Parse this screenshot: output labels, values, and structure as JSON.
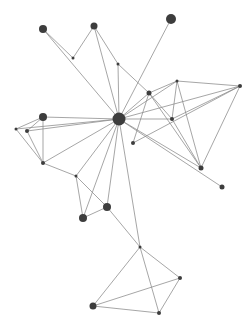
{
  "graph": {
    "type": "network",
    "width": 251,
    "height": 325,
    "colors": {
      "background": "#ffffff",
      "edge": "#8a8a8a",
      "node": "#3d3d3d",
      "hub": "#111111"
    },
    "nodes": [
      {
        "id": "hub",
        "x": 119,
        "y": 119,
        "r": 6.5,
        "color": "#111111"
      },
      {
        "id": "n1",
        "x": 43,
        "y": 29,
        "r": 4
      },
      {
        "id": "n2",
        "x": 94,
        "y": 26,
        "r": 3.5
      },
      {
        "id": "n3",
        "x": 171,
        "y": 19,
        "r": 5
      },
      {
        "id": "n4",
        "x": 73,
        "y": 58,
        "r": 1.5
      },
      {
        "id": "n5",
        "x": 118,
        "y": 64,
        "r": 1.5
      },
      {
        "id": "n6",
        "x": 149,
        "y": 93,
        "r": 2.5
      },
      {
        "id": "n7",
        "x": 177,
        "y": 81,
        "r": 1.5
      },
      {
        "id": "n8",
        "x": 240,
        "y": 86,
        "r": 2
      },
      {
        "id": "n9",
        "x": 172,
        "y": 119,
        "r": 2
      },
      {
        "id": "n10",
        "x": 133,
        "y": 143,
        "r": 2
      },
      {
        "id": "n11",
        "x": 201,
        "y": 168,
        "r": 2.5
      },
      {
        "id": "n12",
        "x": 222,
        "y": 187,
        "r": 2.5
      },
      {
        "id": "n13",
        "x": 43,
        "y": 117,
        "r": 4
      },
      {
        "id": "n14",
        "x": 16,
        "y": 129,
        "r": 1.5
      },
      {
        "id": "n15",
        "x": 27,
        "y": 131,
        "r": 2
      },
      {
        "id": "n16",
        "x": 43,
        "y": 163,
        "r": 2
      },
      {
        "id": "n17",
        "x": 76,
        "y": 176,
        "r": 1.5
      },
      {
        "id": "n18",
        "x": 107,
        "y": 207,
        "r": 4
      },
      {
        "id": "n19",
        "x": 83,
        "y": 218,
        "r": 4
      },
      {
        "id": "n20",
        "x": 140,
        "y": 247,
        "r": 1.5
      },
      {
        "id": "n21",
        "x": 180,
        "y": 278,
        "r": 2
      },
      {
        "id": "n22",
        "x": 159,
        "y": 313,
        "r": 2
      },
      {
        "id": "n23",
        "x": 93,
        "y": 306,
        "r": 3.5
      }
    ],
    "edges": [
      [
        "n1",
        "n4"
      ],
      [
        "n1",
        "hub"
      ],
      [
        "n1",
        "hub2"
      ],
      [
        "n2",
        "n4"
      ],
      [
        "n2",
        "n5"
      ],
      [
        "n2",
        "hub"
      ],
      [
        "n5",
        "n6"
      ],
      [
        "n5",
        "hub"
      ],
      [
        "n3",
        "hub"
      ],
      [
        "hub",
        "n6"
      ],
      [
        "hub",
        "n7"
      ],
      [
        "hub",
        "n8"
      ],
      [
        "hub",
        "n9"
      ],
      [
        "hub",
        "n11"
      ],
      [
        "hub",
        "n12"
      ],
      [
        "n6",
        "n7"
      ],
      [
        "n6",
        "n10"
      ],
      [
        "n6",
        "n9"
      ],
      [
        "n6",
        "n11"
      ],
      [
        "n7",
        "n8"
      ],
      [
        "n7",
        "n9"
      ],
      [
        "n7",
        "n11"
      ],
      [
        "n8",
        "n10"
      ],
      [
        "n8",
        "n11"
      ],
      [
        "n8",
        "n9"
      ],
      [
        "n9",
        "n11"
      ],
      [
        "hub",
        "n13"
      ],
      [
        "hub",
        "n14"
      ],
      [
        "hub",
        "n15"
      ],
      [
        "hub",
        "n16"
      ],
      [
        "n13",
        "n14"
      ],
      [
        "n13",
        "n15"
      ],
      [
        "n13",
        "n16"
      ],
      [
        "n14",
        "n16"
      ],
      [
        "n15",
        "n16"
      ],
      [
        "n16",
        "n17"
      ],
      [
        "hub",
        "n17"
      ],
      [
        "hub",
        "n19"
      ],
      [
        "hub",
        "n18"
      ],
      [
        "hub",
        "n20"
      ],
      [
        "n17",
        "n18"
      ],
      [
        "n17",
        "n19"
      ],
      [
        "n18",
        "n19"
      ],
      [
        "n18",
        "n20"
      ],
      [
        "n20",
        "n21"
      ],
      [
        "n20",
        "n22"
      ],
      [
        "n20",
        "n23"
      ],
      [
        "n21",
        "n22"
      ],
      [
        "n21",
        "n23"
      ],
      [
        "n22",
        "n23"
      ]
    ]
  }
}
